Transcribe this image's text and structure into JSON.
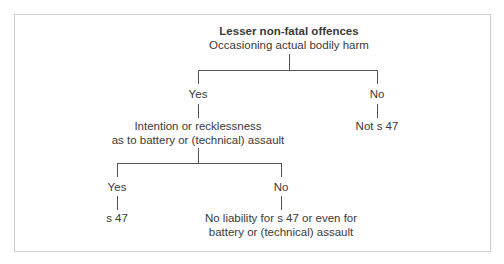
{
  "diagram": {
    "title": "Lesser non-fatal offences",
    "root": "Occasioning actual bodily harm",
    "level1": {
      "yes_label": "Yes",
      "no_label": "No",
      "yes_outcome_line1": "Intention or recklessness",
      "yes_outcome_line2": "as to battery or (technical) assault",
      "no_outcome": "Not s 47"
    },
    "level2": {
      "yes_label": "Yes",
      "no_label": "No",
      "yes_outcome": "s 47",
      "no_outcome_line1": "No liability for s 47 or even for",
      "no_outcome_line2": "battery or (technical) assault"
    }
  }
}
